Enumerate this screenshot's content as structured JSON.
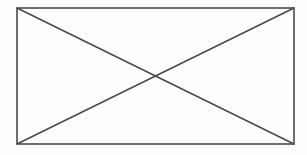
{
  "diagram": {
    "background": "#fdfdfd",
    "stroke_color": "#4a4a4a",
    "stroke_width": 1.6,
    "rectangle": {
      "x": 17,
      "y": 8,
      "width": 277,
      "height": 136
    },
    "diagonals": [
      {
        "name": "diagonal-top-left-to-bottom-right",
        "x1": 17,
        "y1": 8,
        "x2": 294,
        "y2": 144
      },
      {
        "name": "diagonal-bottom-left-to-top-right",
        "x1": 17,
        "y1": 144,
        "x2": 294,
        "y2": 8
      }
    ],
    "intersection": {
      "x": 155.5,
      "y": 76
    }
  }
}
